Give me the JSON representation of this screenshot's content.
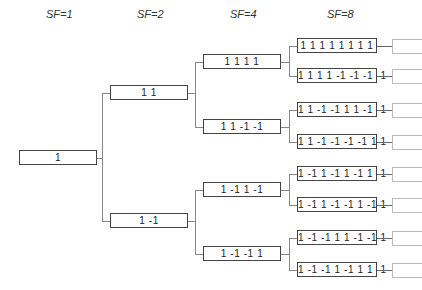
{
  "diagram": {
    "headers": [
      "SF=1",
      "SF=2",
      "SF=4",
      "SF=8"
    ],
    "sf1": [
      "1"
    ],
    "sf2": [
      "1 1",
      "1 -1"
    ],
    "sf4": [
      "1 1 1 1",
      "1 1 -1 -1",
      "1 -1 1 -1",
      "1 -1 -1 1"
    ],
    "sf8": [
      "1 1 1 1 1 1 1 1",
      "1 1 1 1 -1 -1 -1 -1",
      "1 1 -1 -1 1 1 -1 -1",
      "1 1 -1 -1 -1 -1 1 1",
      "1 -1 1 -1 1 -1 1 -1",
      "1 -1 1 -1 -1 1 -1 1",
      "1 -1 -1 1 1 -1 -1 1",
      "1 -1 -1 1 -1 1 1 -1"
    ]
  }
}
